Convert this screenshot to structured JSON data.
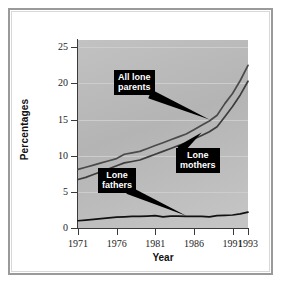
{
  "figure": {
    "frame_color": "#9a9a9a",
    "background": "#ffffff",
    "plot_background": "#bcbcbc"
  },
  "chart_data": {
    "type": "line",
    "title": "",
    "subtitle": "",
    "xlabel": "Year",
    "ylabel": "Percentages",
    "xlim": [
      1971,
      1993
    ],
    "ylim": [
      0,
      26
    ],
    "grid": true,
    "legend_position": "annotations",
    "xtick_labels": [
      "1971",
      "1976",
      "1981",
      "1986",
      "1991",
      "1993"
    ],
    "xticks": [
      1971,
      1976,
      1981,
      1986,
      1991,
      1993
    ],
    "ytick_labels": [
      "0",
      "5",
      "10",
      "15",
      "20",
      "25"
    ],
    "yticks": [
      0,
      5,
      10,
      15,
      20,
      25
    ],
    "x": [
      1971,
      1972,
      1973,
      1974,
      1975,
      1976,
      1977,
      1978,
      1979,
      1980,
      1981,
      1982,
      1983,
      1984,
      1985,
      1986,
      1987,
      1988,
      1989,
      1990,
      1991,
      1992,
      1993
    ],
    "series": [
      {
        "name": "All lone parents",
        "color": "#4a4a4a",
        "values": [
          8.1,
          8.4,
          8.7,
          9.0,
          9.3,
          9.6,
          10.2,
          10.4,
          10.6,
          11.0,
          11.4,
          11.8,
          12.2,
          12.6,
          13.0,
          13.6,
          14.2,
          14.8,
          15.6,
          17.2,
          18.6,
          20.4,
          22.5
        ]
      },
      {
        "name": "Lone mothers",
        "color": "#3d3d3d",
        "values": [
          6.7,
          7.0,
          7.4,
          7.8,
          8.2,
          8.6,
          9.0,
          9.2,
          9.4,
          9.8,
          10.2,
          10.6,
          11.0,
          11.4,
          11.8,
          12.3,
          12.8,
          13.3,
          14.0,
          15.4,
          16.8,
          18.4,
          20.3
        ]
      },
      {
        "name": "Lone fathers",
        "color": "#111111",
        "values": [
          1.0,
          1.1,
          1.2,
          1.3,
          1.4,
          1.5,
          1.55,
          1.6,
          1.6,
          1.65,
          1.7,
          1.55,
          1.65,
          1.65,
          1.6,
          1.6,
          1.6,
          1.55,
          1.7,
          1.75,
          1.8,
          1.95,
          2.2
        ]
      }
    ],
    "annotations": [
      {
        "label": "All lone\nparents",
        "target_x": 1988,
        "target_y": 15.0
      },
      {
        "label": "Lone\nmothers",
        "target_x": 1987,
        "target_y": 13.2
      },
      {
        "label": "Lone\nfathers",
        "target_x": 1985,
        "target_y": 1.7
      }
    ]
  }
}
